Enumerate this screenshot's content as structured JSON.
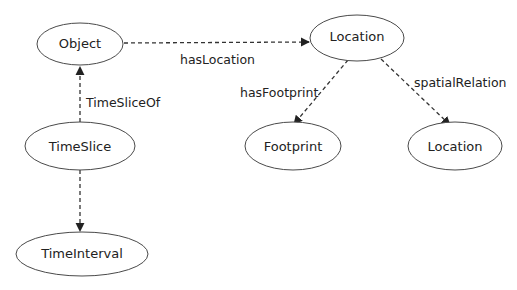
{
  "diagram": {
    "type": "ontology-graph",
    "nodes": [
      {
        "id": "object",
        "label": "Object"
      },
      {
        "id": "location_top",
        "label": "Location"
      },
      {
        "id": "timeslice",
        "label": "TimeSlice"
      },
      {
        "id": "footprint",
        "label": "Footprint"
      },
      {
        "id": "location_bottom",
        "label": "Location"
      },
      {
        "id": "timeinterval",
        "label": "TimeInterval"
      }
    ],
    "edges": [
      {
        "from": "object",
        "to": "location_top",
        "label": "hasLocation",
        "style": "dashed"
      },
      {
        "from": "timeslice",
        "to": "object",
        "label": "TimeSliceOf",
        "style": "dashed"
      },
      {
        "from": "timeslice",
        "to": "timeinterval",
        "label": "",
        "style": "dashed"
      },
      {
        "from": "location_top",
        "to": "footprint",
        "label": "hasFootprint",
        "style": "dashed"
      },
      {
        "from": "location_top",
        "to": "location_bottom",
        "label": "spatialRelation",
        "style": "dashed"
      }
    ]
  }
}
